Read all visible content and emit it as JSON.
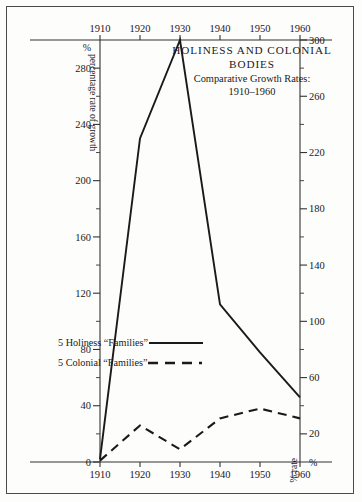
{
  "figure": {
    "title_line1": "HOLINESS AND COLONIAL",
    "title_line2": "BODIES",
    "subtitle": "Comparative Growth Rates:",
    "subtitle_years": "1910–1960"
  },
  "axes": {
    "y_left_title": "percentage rate of growth",
    "y_left_top_symbol": "%",
    "y_left_zero": "0",
    "y_right_title": "% rate",
    "y_right_bottom_symbol": "%",
    "x_top_labels": [
      "1910",
      "1920",
      "1930",
      "1940",
      "1950",
      "1960"
    ],
    "x_bottom_labels": [
      "1910",
      "1920",
      "1930",
      "1940",
      "1950",
      "1960"
    ],
    "y_left_labels": [
      "280",
      "240",
      "200",
      "160",
      "120",
      "80",
      "40"
    ],
    "y_right_labels": [
      "300",
      "260",
      "220",
      "180",
      "140",
      "100",
      "60",
      "20"
    ]
  },
  "legend": {
    "items": [
      {
        "label": "5 Holiness “Families”",
        "style": "solid"
      },
      {
        "label": "5 Colonial “Families”",
        "style": "dashed"
      }
    ]
  },
  "chart_data": {
    "type": "line",
    "xlabel": "",
    "ylabel": "percentage rate of growth",
    "y2label": "% rate",
    "x": [
      1910,
      1920,
      1930,
      1940,
      1950,
      1960
    ],
    "xlim": [
      1910,
      1960
    ],
    "ylim": [
      0,
      300
    ],
    "y_major_ticks": [
      0,
      40,
      80,
      120,
      160,
      200,
      240,
      280
    ],
    "y_minor_ticks": [
      20,
      60,
      100,
      140,
      180,
      220,
      260,
      300
    ],
    "y2_ticks": [
      20,
      60,
      100,
      140,
      180,
      220,
      260,
      300
    ],
    "grid": false,
    "legend_position": "inside-left",
    "series": [
      {
        "name": "5 Holiness “Families”",
        "style": "solid",
        "values": [
          2,
          230,
          300,
          112,
          78,
          46
        ]
      },
      {
        "name": "5 Colonial “Families”",
        "style": "dashed",
        "values": [
          1,
          26,
          9,
          31,
          38,
          31
        ]
      }
    ],
    "colors": {
      "line": "#1a1a1a",
      "axis": "#333333",
      "background": "#fdfdfc"
    }
  }
}
